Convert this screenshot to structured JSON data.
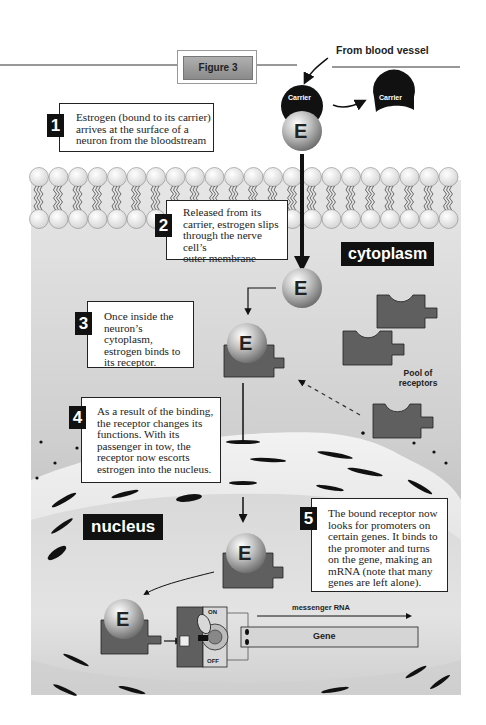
{
  "figure": {
    "title": "Figure 3",
    "source_label": "From blood vessel",
    "carrier_label": "Carrier",
    "estrogen_label": "E",
    "region_labels": {
      "cytoplasm": "cytoplasm",
      "nucleus": "nucleus"
    },
    "pool_label": "Pool of\nreceptors",
    "switch": {
      "on": "ON",
      "off": "OFF"
    },
    "mrna_label": "messenger RNA",
    "gene_label": "Gene"
  },
  "steps": [
    {
      "num": "1",
      "text": "Estrogen (bound to its carrier)\narrives at the surface of a\nneuron from the bloodstream"
    },
    {
      "num": "2",
      "text": "Released from its\ncarrier, estrogen slips\nthrough the nerve cell’s\nouter membrane"
    },
    {
      "num": "3",
      "text": "Once inside the\nneuron’s cytoplasm,\nestrogen binds to\nits receptor."
    },
    {
      "num": "4",
      "text": "As a result of the binding,\nthe receptor changes its\nfunctions. With its\npassenger in tow, the\nreceptor now escorts\nestrogen into the nucleus."
    },
    {
      "num": "5",
      "text": "The bound receptor now\nlooks for promoters on\ncertain genes. It binds to\nthe promoter and turns\non the gene, making an\nmRNA (note that many\ngenes are left alone)."
    }
  ],
  "colors": {
    "receptor": "#5f5f5f",
    "cytoplasm_bg": "#c9c9c9",
    "nucleus_bg": "#dcdcdc",
    "carrier": "#111111",
    "label_bg": "#111111"
  }
}
